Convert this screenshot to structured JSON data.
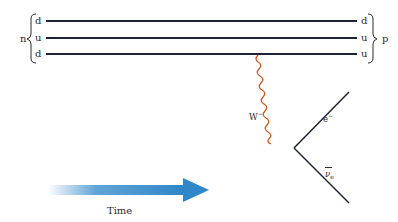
{
  "diagram": {
    "type": "feynman-diagram",
    "neutron": {
      "label": "n",
      "quarks": [
        "d",
        "u",
        "d"
      ]
    },
    "proton": {
      "label": "p",
      "quarks": [
        "d",
        "u",
        "u"
      ]
    },
    "boson": {
      "label": "W",
      "charge": "−",
      "color": "#d9541e"
    },
    "products": {
      "electron": {
        "label": "e",
        "charge": "−"
      },
      "antineutrino": {
        "label": "ν",
        "subscript": "e"
      }
    },
    "time_arrow": {
      "label": "Time",
      "color": "#2f86c8"
    },
    "line_color": "#1e2233"
  }
}
